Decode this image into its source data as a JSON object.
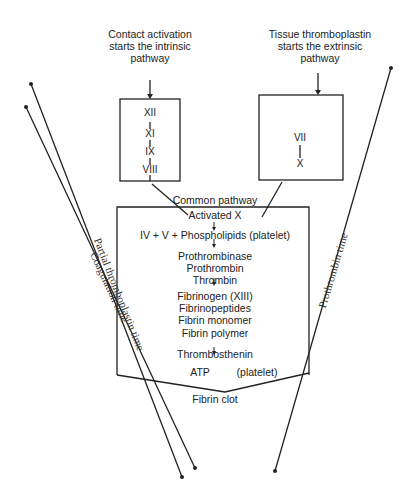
{
  "intrinsic": {
    "caption": [
      "Contact activation",
      "starts the intrinsic",
      "pathway"
    ],
    "factors": [
      "XII",
      "XI",
      "IX",
      "VIII",
      "X"
    ]
  },
  "extrinsic": {
    "caption": [
      "Tissue thromboplastin",
      "starts the extrinsic",
      "pathway"
    ],
    "factors": [
      "VII",
      "X"
    ]
  },
  "common": {
    "title": "Common pathway",
    "steps": [
      "Activated X",
      "IV + V + Phospholipids (platelet)",
      "Prothrombinase",
      "Prothrombin",
      "Thrombin",
      "Fibrinogen (XIII)",
      "Fibrinopeptides",
      "Fibrin monomer",
      "Fibrin polymer",
      "Thrombosthenin",
      "ATP",
      "(platelet)"
    ],
    "result": "Fibrin clot"
  },
  "tests": {
    "ptt": "Partial thromboplastin time",
    "coag": "Coagulation time",
    "pt": "Prothrombin time"
  },
  "colors": {
    "ink": "#222222",
    "background": "#ffffff"
  }
}
